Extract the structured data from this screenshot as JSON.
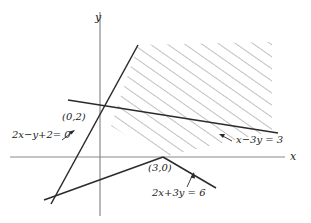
{
  "figure": {
    "type": "linear-inequality-region-diagram",
    "background_color": "#ffffff",
    "line_color": "#2b2b2b",
    "axis_color": "#8a8a8a",
    "hatch_color": "#8c8c8c",
    "text_color": "#1b1b1b"
  },
  "axes": {
    "x_label": "x",
    "y_label": "y",
    "origin_px": {
      "x": 100,
      "y": 157
    }
  },
  "points": [
    {
      "name": "y-intercept-point",
      "label": "(0,2)",
      "px": {
        "x": 100,
        "y": 118
      }
    },
    {
      "name": "x-intercept-point",
      "label": "(3,0)",
      "px": {
        "x": 163,
        "y": 157
      }
    }
  ],
  "lines": [
    {
      "name": "line-2x-minus-y-plus-2",
      "label": "2x−y+2= 0",
      "equation": "2x - y + 2 = 0",
      "label_px": {
        "x": 12,
        "y": 135
      }
    },
    {
      "name": "line-x-minus-3y",
      "label": "x−3y = 3",
      "equation": "x - 3y = 3",
      "label_px": {
        "x": 236,
        "y": 140
      }
    },
    {
      "name": "line-2x-plus-3y",
      "label": "2x+3y = 6",
      "equation": "2x + 3y = 6",
      "label_px": {
        "x": 155,
        "y": 191
      }
    }
  ],
  "region": {
    "name": "feasible-region",
    "fill": "diagonal-hatch",
    "description": "hatched region bounded below-left by the lines through (0,2) and (3,0)"
  }
}
